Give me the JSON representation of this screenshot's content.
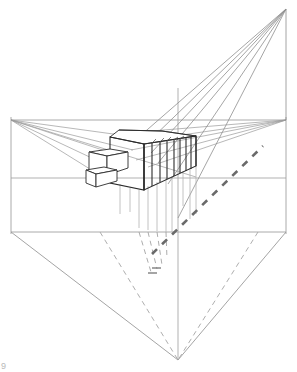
{
  "document": {
    "title": "Two-Point Perspective Shadow Construction",
    "medium": "line-drawing",
    "background_color": "#ffffff",
    "width": 297,
    "height": 372,
    "corner_mark": "9"
  },
  "palette": {
    "construction_line": "#9a9a9a",
    "light_construction_line": "#b5b5b5",
    "object_outline": "#2b2b2b",
    "medium_line": "#6e6e6e",
    "dashed_line": "#8d8d8d",
    "thick_dashed_line": "#6a6a6a",
    "frame_line": "#a0a0a0"
  },
  "construction": {
    "horizon_line_y": 120,
    "ground_line_y": 178,
    "base_line_y": 232,
    "left_vanishing_point": {
      "label": "VPL",
      "x": 11,
      "y": 120
    },
    "right_vanishing_point": {
      "label": "VPR",
      "x": 286,
      "y": 120
    },
    "light_source_point": {
      "label": "LS",
      "x": 286,
      "y": 9
    },
    "light_foot_point": {
      "label": "LSF",
      "x": 178,
      "y": 360
    },
    "center_vertical_x": 178,
    "left_frame_x": 11,
    "right_frame_x": 286,
    "center_vertical_top_y": 88,
    "center_vertical_bottom_y": 360
  },
  "frame_lines": [
    {
      "name": "horizon-line",
      "x1": 11,
      "y1": 120,
      "x2": 286,
      "y2": 120
    },
    {
      "name": "ground-line",
      "x1": 11,
      "y1": 178,
      "x2": 286,
      "y2": 178
    },
    {
      "name": "base-line",
      "x1": 11,
      "y1": 232,
      "x2": 286,
      "y2": 232
    },
    {
      "name": "left-vertical",
      "x1": 11,
      "y1": 118,
      "x2": 11,
      "y2": 234
    },
    {
      "name": "right-vertical",
      "x1": 286,
      "y1": 118,
      "x2": 286,
      "y2": 234
    },
    {
      "name": "center-vertical",
      "x1": 178,
      "y1": 88,
      "x2": 178,
      "y2": 360
    }
  ],
  "lower_triangle": [
    {
      "name": "triangle-left-edge",
      "x1": 11,
      "y1": 232,
      "x2": 178,
      "y2": 360
    },
    {
      "name": "triangle-right-edge",
      "x1": 286,
      "y1": 232,
      "x2": 178,
      "y2": 360
    }
  ],
  "lower_dashed_rays": [
    {
      "name": "dashed-ray-left",
      "x1": 100,
      "y1": 232,
      "x2": 178,
      "y2": 360
    },
    {
      "name": "dashed-ray-right",
      "x1": 258,
      "y1": 232,
      "x2": 178,
      "y2": 360
    }
  ],
  "vanishing_rays_left": [
    {
      "name": "vpl-ray-1",
      "x2": 129,
      "y2": 137
    },
    {
      "name": "vpl-ray-2",
      "x2": 131,
      "y2": 150
    },
    {
      "name": "vpl-ray-3",
      "x2": 120,
      "y2": 156
    },
    {
      "name": "vpl-ray-4",
      "x2": 112,
      "y2": 168
    },
    {
      "name": "vpl-ray-5",
      "x2": 104,
      "y2": 177
    },
    {
      "name": "vpl-ray-6",
      "x2": 189,
      "y2": 176
    }
  ],
  "vanishing_rays_right": [
    {
      "name": "vpr-ray-1",
      "x2": 134,
      "y2": 136
    },
    {
      "name": "vpr-ray-2",
      "x2": 137,
      "y2": 142
    },
    {
      "name": "vpr-ray-3",
      "x2": 135,
      "y2": 148
    },
    {
      "name": "vpr-ray-4",
      "x2": 135,
      "y2": 160
    },
    {
      "name": "vpr-ray-5",
      "x2": 146,
      "y2": 166
    }
  ],
  "light_rays": [
    {
      "name": "light-ray-1",
      "x2": 140,
      "y2": 136
    },
    {
      "name": "light-ray-2",
      "x2": 145,
      "y2": 143
    },
    {
      "name": "light-ray-3",
      "x2": 150,
      "y2": 152
    },
    {
      "name": "light-ray-4",
      "x2": 157,
      "y2": 161
    },
    {
      "name": "light-ray-5",
      "x2": 167,
      "y2": 182
    },
    {
      "name": "light-ray-6",
      "x2": 178,
      "y2": 215
    }
  ],
  "building": {
    "name": "colonnade-block",
    "main_slab": {
      "top_face": "110,137 162,131 196,136 144,144",
      "front_top_edge": {
        "x1": 110,
        "y1": 137,
        "x2": 196,
        "y2": 136
      },
      "left_face_outline": "110,137 110,183 144,190 144,144",
      "front_outline": "144,144 196,136 196,165 144,190"
    },
    "pillars": [
      {
        "name": "pillar-1",
        "x_top": 144,
        "y_top": 144,
        "x_bot": 144,
        "y_bot": 190
      },
      {
        "name": "pillar-2",
        "x_top": 152,
        "y_top": 142,
        "x_bot": 152,
        "y_bot": 186
      },
      {
        "name": "pillar-3",
        "x_top": 160,
        "y_top": 141,
        "x_bot": 160,
        "y_bot": 182
      },
      {
        "name": "pillar-4",
        "x_top": 167,
        "y_top": 140,
        "x_bot": 167,
        "y_bot": 178
      },
      {
        "name": "pillar-5",
        "x_top": 174,
        "y_top": 139,
        "x_bot": 174,
        "y_bot": 175
      },
      {
        "name": "pillar-6",
        "x_top": 180,
        "y_top": 138,
        "x_bot": 180,
        "y_bot": 172
      },
      {
        "name": "pillar-7",
        "x_top": 186,
        "y_top": 137,
        "x_bot": 186,
        "y_bot": 170
      },
      {
        "name": "pillar-8",
        "x_top": 191,
        "y_top": 137,
        "x_bot": 191,
        "y_bot": 168
      },
      {
        "name": "pillar-9",
        "x_top": 196,
        "y_top": 136,
        "x_bot": 196,
        "y_bot": 166
      }
    ],
    "annex_upper_box": {
      "name": "upper-annex-box",
      "top_face": "89,152 110,149 128,152 107,156",
      "front_face": "89,152 89,171 107,175 107,156",
      "right_face": "107,156 128,152 128,168 107,175"
    },
    "annex_lower_box": {
      "name": "lower-annex-box",
      "top_face": "86,170 107,167 117,170 96,174",
      "front_face": "86,170 86,182 96,186 96,174",
      "right_face": "96,174 117,170 117,180 96,186"
    },
    "roof_ridge": {
      "x1": 119,
      "y1": 130,
      "x2": 162,
      "y2": 131
    }
  },
  "drop_lines": [
    {
      "name": "drop-line-1",
      "x": 139,
      "y1": 190,
      "y2": 228
    },
    {
      "name": "drop-line-2",
      "x": 148,
      "y1": 186,
      "y2": 230
    },
    {
      "name": "drop-line-3",
      "x": 157,
      "y1": 182,
      "y2": 231
    },
    {
      "name": "drop-line-4",
      "x": 166,
      "y1": 178,
      "y2": 232
    },
    {
      "name": "drop-line-5",
      "x": 175,
      "y1": 175,
      "y2": 232
    },
    {
      "name": "drop-line-6",
      "x": 190,
      "y1": 168,
      "y2": 219
    },
    {
      "name": "drop-line-7",
      "x": 196,
      "y1": 166,
      "y2": 216
    },
    {
      "name": "drop-line-8",
      "x": 120,
      "y1": 183,
      "y2": 215
    },
    {
      "name": "drop-line-9",
      "x": 130,
      "y1": 188,
      "y2": 212
    }
  ],
  "shadow_dashed_rays": [
    {
      "name": "shadow-ray-1",
      "x1": 139,
      "y1": 232,
      "x2": 151,
      "y2": 272
    },
    {
      "name": "shadow-ray-2",
      "x1": 148,
      "y1": 232,
      "x2": 157,
      "y2": 268
    },
    {
      "name": "shadow-ray-3",
      "x1": 157,
      "y1": 232,
      "x2": 162,
      "y2": 264
    },
    {
      "name": "shadow-ray-4",
      "x1": 166,
      "y1": 232,
      "x2": 166,
      "y2": 258
    }
  ],
  "shadow_base_marks": [
    {
      "name": "shadow-base-mark-1",
      "x1": 148,
      "y1": 273,
      "x2": 157,
      "y2": 273
    },
    {
      "name": "shadow-base-mark-2",
      "x1": 151,
      "y1": 268,
      "x2": 160,
      "y2": 268
    }
  ],
  "thick_dashed_diagonal": {
    "name": "light-direction-dashed-line",
    "x1": 152,
    "y1": 253,
    "x2": 262,
    "y2": 147,
    "dash_pattern": "7 7",
    "stroke_width": 2.6
  }
}
